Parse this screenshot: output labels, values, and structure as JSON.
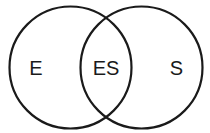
{
  "diagram": {
    "type": "venn",
    "sets": [
      {
        "id": "left",
        "label": "E",
        "cx": 70.5,
        "cy": 67.5,
        "r": 61
      },
      {
        "id": "right",
        "label": "S",
        "cx": 141.5,
        "cy": 67.5,
        "r": 61
      }
    ],
    "intersection": {
      "label": "ES"
    },
    "stroke_color": "#1a1a1a"
  }
}
